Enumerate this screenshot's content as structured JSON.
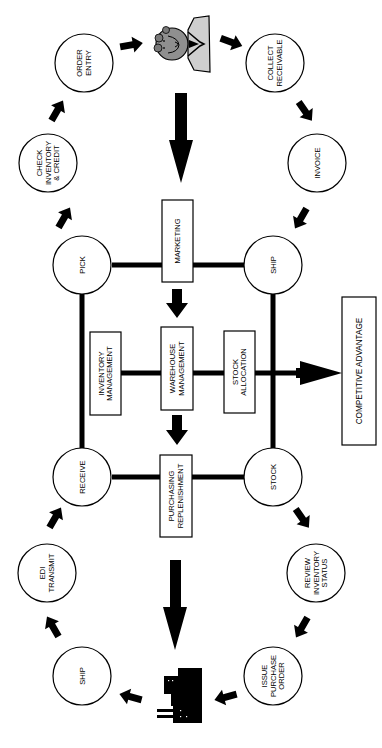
{
  "diagram": {
    "orientation": "rotated 90 degrees clockwise",
    "colors": {
      "ink": "#000000",
      "paper": "#ffffff",
      "shade": "#cfcfcf"
    },
    "outer_cycle_top": {
      "nodes": [
        {
          "id": "pick_source",
          "label_lines": [
            "PICK"
          ]
        },
        {
          "id": "check_inventory",
          "label_lines": [
            "CHECK",
            "INVENTORY",
            "& CREDIT"
          ]
        },
        {
          "id": "order_entry",
          "label_lines": [
            "ORDER",
            "ENTRY"
          ]
        },
        {
          "id": "customer",
          "icon": "customer-person-icon"
        },
        {
          "id": "collect_receivable",
          "label_lines": [
            "COLLECT",
            "RECEIVABLE"
          ]
        },
        {
          "id": "invoice",
          "label_lines": [
            "INVOICE"
          ]
        },
        {
          "id": "ship_top",
          "label_lines": [
            "SHIP"
          ]
        }
      ]
    },
    "outer_cycle_bottom": {
      "nodes": [
        {
          "id": "stock_source",
          "label_lines": [
            "STOCK"
          ]
        },
        {
          "id": "review_inventory",
          "label_lines": [
            "REVIEW",
            "INVENTORY",
            "STATUS"
          ]
        },
        {
          "id": "issue_po",
          "label_lines": [
            "ISSUE",
            "PURCHASE",
            "ORDER"
          ]
        },
        {
          "id": "supplier",
          "icon": "factory-icon"
        },
        {
          "id": "ship_bottom",
          "label_lines": [
            "SHIP"
          ]
        },
        {
          "id": "edi_transmit",
          "label_lines": [
            "EDI",
            "TRANSMIT"
          ]
        },
        {
          "id": "receive",
          "label_lines": [
            "RECEIVE"
          ]
        }
      ]
    },
    "hub": {
      "corners": {
        "pick": [
          "PICK"
        ],
        "ship": [
          "SHIP"
        ],
        "receive": [
          "RECEIVE"
        ],
        "stock": [
          "STOCK"
        ]
      },
      "boxes": {
        "marketing": [
          "MARKETING"
        ],
        "inventory_management": [
          "INVENTORY",
          "MANAGEMENT"
        ],
        "warehouse_management": [
          "WAREHOUSE",
          "MANAGEMENT"
        ],
        "stock_allocation": [
          "STOCK",
          "ALLOCATION"
        ],
        "purchasing_replenishment": [
          "PURCHASING",
          "REPLENISHMENT"
        ]
      }
    },
    "outcome": {
      "label": "COMPETITIVE ADVANTAGE"
    }
  }
}
